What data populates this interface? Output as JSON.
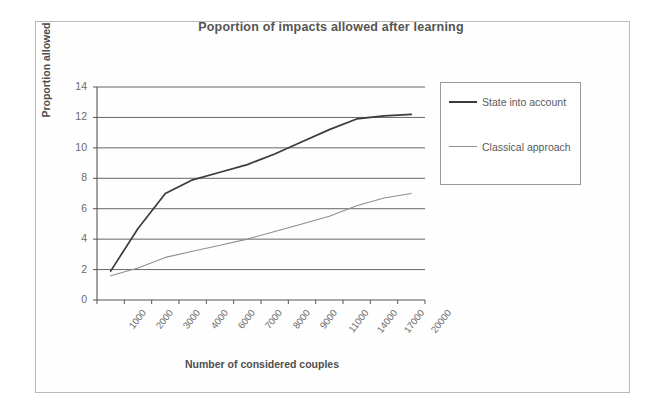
{
  "figure": {
    "title": "Poportion of impacts allowed after learning",
    "x_axis_title": "Number of considered couples",
    "y_axis_title": "Proportion allowed"
  },
  "legend": {
    "items": [
      {
        "label": "State into account",
        "color": "#3b3b3b",
        "style": "thick"
      },
      {
        "label": "Classical approach",
        "color": "#8e8e8e",
        "style": "thin"
      }
    ]
  },
  "chart_data": {
    "type": "line",
    "title": "Poportion of impacts allowed after learning",
    "xlabel": "Number of considered couples",
    "ylabel": "Proportion allowed",
    "categories": [
      "1000",
      "2000",
      "3000",
      "4000",
      "6000",
      "7000",
      "8000",
      "9000",
      "11000",
      "14000",
      "17000",
      "20000"
    ],
    "ylim": [
      0,
      14
    ],
    "yticks": [
      0,
      2,
      4,
      6,
      8,
      10,
      12,
      14
    ],
    "grid": "horizontal",
    "legend_position": "right-outside",
    "series": [
      {
        "name": "State into account",
        "color": "#3b3b3b",
        "values": [
          1.9,
          4.7,
          7.0,
          7.9,
          8.4,
          8.9,
          9.6,
          10.4,
          11.2,
          11.9,
          12.1,
          12.2
        ]
      },
      {
        "name": "Classical approach",
        "color": "#8e8e8e",
        "values": [
          1.6,
          2.1,
          2.8,
          3.2,
          3.6,
          4.0,
          4.5,
          5.0,
          5.5,
          6.2,
          6.7,
          7.0
        ]
      }
    ]
  }
}
